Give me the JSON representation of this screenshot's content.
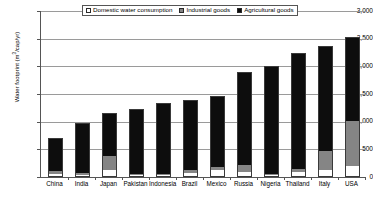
{
  "chart_data": {
    "type": "bar",
    "subtype": "stacked-vertical",
    "title": "",
    "xlabel": "",
    "ylabel": "Water footprint (m3/cap/yr)",
    "ylim": [
      0,
      3000
    ],
    "ytick_values": [
      0,
      500,
      1000,
      1500,
      2000,
      2500,
      3000
    ],
    "ytick_labels": [
      "0",
      "500",
      "1,000",
      "1,500",
      "2,000",
      "2,500",
      "3,000"
    ],
    "grid": true,
    "legend_position": "top-center",
    "categories": [
      "China",
      "India",
      "Japan",
      "Pakistan",
      "Indonesia",
      "Brazil",
      "Mexico",
      "Russia",
      "Nigeria",
      "Thailand",
      "Italy",
      "USA"
    ],
    "series": [
      {
        "name": "Domestic water consumption",
        "color": "#ffffff",
        "values": [
          30,
          20,
          110,
          25,
          25,
          65,
          105,
          65,
          20,
          65,
          110,
          190
        ]
      },
      {
        "name": "Industrial goods",
        "color": "#858585",
        "values": [
          70,
          40,
          270,
          20,
          20,
          55,
          55,
          130,
          15,
          55,
          340,
          820
        ]
      },
      {
        "name": "Agricultural goods",
        "color": "#0d0d0d",
        "values": [
          600,
          920,
          770,
          1180,
          1290,
          1280,
          1310,
          1695,
          1980,
          2130,
          1920,
          1520
        ]
      }
    ],
    "totals": [
      700,
      980,
      1150,
      1225,
      1335,
      1400,
      1470,
      1890,
      2015,
      2250,
      2370,
      2530
    ]
  },
  "legend": {
    "items": [
      {
        "label": "Domestic water consumption",
        "swatch": "domestic-swatch"
      },
      {
        "label": "Industrial goods",
        "swatch": "industrial-swatch"
      },
      {
        "label": "Agricultural goods",
        "swatch": "agricultural-swatch"
      }
    ]
  },
  "axes": {
    "y_title_main": "Water footprint (m",
    "y_title_sup": "3",
    "y_title_tail": "/cap/yr)"
  }
}
